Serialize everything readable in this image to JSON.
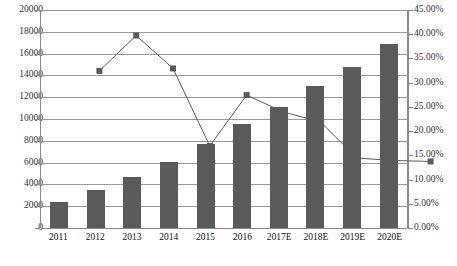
{
  "chart_data": {
    "type": "bar",
    "title": "",
    "subtitle": "",
    "xlabel": "",
    "ylabel": "",
    "grid": true,
    "legend_position": "none",
    "categories": [
      "2011",
      "2012",
      "2013",
      "2014",
      "2015",
      "2016",
      "2017E",
      "2018E",
      "2019E",
      "2020E"
    ],
    "axes": {
      "left": {
        "min": 0,
        "max": 20000,
        "step": 2000,
        "ticks": [
          "0",
          "2000",
          "4000",
          "6000",
          "8000",
          "10000",
          "12000",
          "14000",
          "16000",
          "18000",
          "20000"
        ]
      },
      "right": {
        "min": 0,
        "max": 45,
        "step": 5,
        "unit": "%",
        "ticks": [
          "0.00%",
          "5.00%",
          "10.00%",
          "15.00%",
          "20.00%",
          "25.00%",
          "30.00%",
          "35.00%",
          "40.00%",
          "45.00%"
        ]
      }
    },
    "series": [
      {
        "name": "bars",
        "type": "bar",
        "axis": "left",
        "color": "#5a5a5a",
        "values": [
          2400,
          3500,
          4700,
          6100,
          7700,
          9500,
          11100,
          13000,
          14800,
          16900
        ]
      },
      {
        "name": "line",
        "type": "line",
        "axis": "right",
        "color": "#5a5a5a",
        "marker": "square",
        "values": [
          34.5,
          41.8,
          35.0,
          19.0,
          29.5,
          26.0,
          24.0,
          16.5,
          16.0,
          15.8
        ]
      }
    ]
  },
  "colors": {
    "bar": "#5a5a5a",
    "line": "#5a5a5a",
    "grid": "#9a9a9a",
    "axis": "#8a8a8a",
    "text": "#111111",
    "background": "#ffffff"
  }
}
